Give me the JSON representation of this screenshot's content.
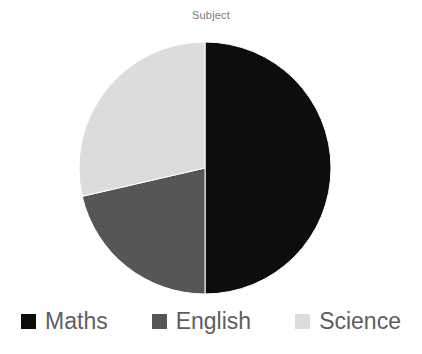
{
  "chart": {
    "title": "Subject",
    "background_color": "#FFFFFF",
    "title_color": "#7B7B7B"
  },
  "legend": {
    "position": "bottom",
    "items": [
      {
        "label": "Maths",
        "color": "#0D0D0D",
        "marker": "square-marker-icon"
      },
      {
        "label": "English",
        "color": "#565656",
        "marker": "square-marker-icon"
      },
      {
        "label": "Science",
        "color": "#DCDCDC",
        "marker": "square-marker-icon"
      }
    ]
  },
  "chart_data": {
    "type": "pie",
    "title": "Subject",
    "xlabel": "",
    "ylabel": "",
    "categories": [
      "Maths",
      "English",
      "Science"
    ],
    "values": [
      50.0,
      21.4,
      28.6
    ],
    "units": "percent",
    "start_angle_deg": 0,
    "direction": "clockwise",
    "slice_angles_deg": [
      180,
      77,
      103
    ],
    "colors": [
      "#0D0D0D",
      "#565656",
      "#DCDCDC"
    ],
    "legend_position": "bottom",
    "grid": false,
    "data_labels_shown": false,
    "center_px": [
      205,
      168
    ],
    "radius_px": 126
  }
}
